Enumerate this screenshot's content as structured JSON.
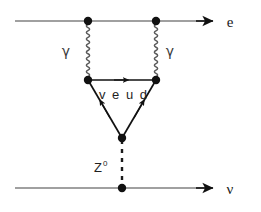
{
  "figure": {
    "kind": "feynman-diagram",
    "title": "",
    "background_color": "#ffffff",
    "line_color": "#808080",
    "ink_color": "#111111",
    "loop_line_color": "#1a1a1a",
    "width": 261,
    "height": 212
  },
  "labels": {
    "electron_out": "e",
    "neutrino_out": "ν",
    "photon_left": "γ",
    "photon_right": "γ",
    "loop_fermions": "v e u d",
    "z_boson": "Z",
    "z_boson_superscript": "0"
  },
  "lines": {
    "electron_line": {
      "name": "electron-line",
      "type": "fermion-straight",
      "x1": 15,
      "y1": 21,
      "x2": 213,
      "y2": 21,
      "arrow": "right-end"
    },
    "neutrino_line": {
      "name": "neutrino-line",
      "type": "fermion-straight",
      "x1": 15,
      "y1": 188,
      "x2": 213,
      "y2": 188,
      "arrow": "right-end"
    },
    "photon_left": {
      "name": "photon-left",
      "type": "wavy",
      "x": 88,
      "y1": 21,
      "y2": 80,
      "amplitude": 3.2,
      "cycles": 9
    },
    "photon_right": {
      "name": "photon-right",
      "type": "wavy",
      "x": 156,
      "y1": 21,
      "y2": 80,
      "amplitude": 3.2,
      "cycles": 9
    },
    "loop_top": {
      "name": "loop-top-edge",
      "type": "fermion-straight",
      "x1": 88,
      "y1": 80,
      "x2": 156,
      "y2": 80,
      "arrow": "right-mid"
    },
    "loop_left": {
      "name": "loop-left-edge",
      "type": "fermion-straight",
      "x1": 122,
      "y1": 138,
      "x2": 88,
      "y2": 80,
      "arrow": "toward-upper-left-mid"
    },
    "loop_right": {
      "name": "loop-right-edge",
      "type": "fermion-straight",
      "x1": 122,
      "y1": 138,
      "x2": 156,
      "y2": 80,
      "arrow": "toward-upper-right-mid"
    },
    "z_line": {
      "name": "z-boson-line",
      "type": "dashed",
      "x": 122,
      "y1": 138,
      "y2": 188,
      "dash": "4 5"
    }
  },
  "vertices": [
    {
      "name": "vertex-electron-left",
      "x": 88,
      "y": 21,
      "r": 4.2
    },
    {
      "name": "vertex-electron-right",
      "x": 156,
      "y": 21,
      "r": 4.2
    },
    {
      "name": "vertex-loop-left",
      "x": 88,
      "y": 80,
      "r": 4.2
    },
    {
      "name": "vertex-loop-right",
      "x": 156,
      "y": 80,
      "r": 4.2
    },
    {
      "name": "vertex-loop-apex",
      "x": 122,
      "y": 138,
      "r": 4.2
    },
    {
      "name": "vertex-neutrino",
      "x": 122,
      "y": 188,
      "r": 4.2
    }
  ],
  "label_positions": {
    "electron_out": {
      "x": 230,
      "y": 27
    },
    "neutrino_out": {
      "x": 230,
      "y": 194
    },
    "photon_left": {
      "x": 66,
      "y": 55
    },
    "photon_right": {
      "x": 166,
      "y": 55
    },
    "loop_fermions": {
      "x": 99,
      "y": 99
    },
    "z_boson": {
      "x": 96,
      "y": 171
    }
  }
}
